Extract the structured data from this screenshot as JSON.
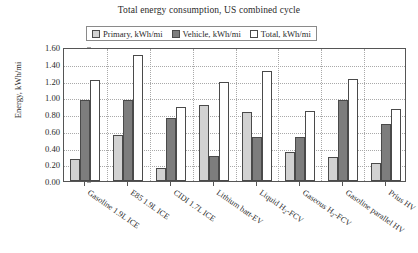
{
  "chart_data": {
    "type": "bar",
    "title": "Total energy consumption, US combined cycle",
    "xlabel": "",
    "ylabel": "Energy, kWh/mi",
    "ylim": [
      0.0,
      1.6
    ],
    "ytick_labels": [
      "0.00",
      "0.20",
      "0.40",
      "0.60",
      "0.80",
      "1.00",
      "1.20",
      "1.40",
      "1.60"
    ],
    "ytick_values": [
      0.0,
      0.2,
      0.4,
      0.6,
      0.8,
      1.0,
      1.2,
      1.4,
      1.6
    ],
    "grid": true,
    "legend_position": "top-center",
    "categories": [
      "Gasoline 1.9L ICE",
      "E85 1.9L ICE",
      "CIDI 1.7L ICE",
      "Lithium batt-EV",
      "Liquid H₂-FCV",
      "Gaseous H₂-FCV",
      "Gasoline parallel HV",
      "Prius HV"
    ],
    "series": [
      {
        "name": "Primary, kWh/mi",
        "color": "#d2d2d2",
        "values": [
          0.26,
          0.55,
          0.15,
          0.91,
          0.83,
          0.35,
          0.29,
          0.21
        ]
      },
      {
        "name": "Vehicle, kWh/mi",
        "color": "#7d7d7d",
        "values": [
          0.97,
          0.97,
          0.75,
          0.3,
          0.52,
          0.52,
          0.97,
          0.68
        ]
      },
      {
        "name": "Total, kWh/mi",
        "color": "#ffffff",
        "values": [
          1.21,
          1.51,
          0.88,
          1.18,
          1.31,
          0.84,
          1.22,
          0.86
        ]
      }
    ]
  }
}
